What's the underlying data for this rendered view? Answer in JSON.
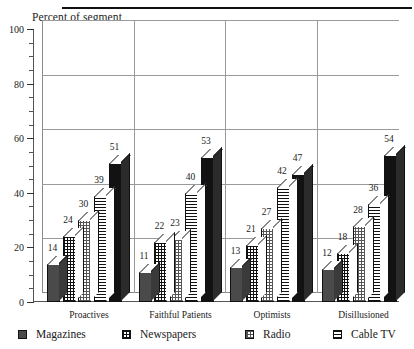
{
  "chart_data": {
    "type": "bar",
    "title": "Percent of segment",
    "xlabel": "",
    "ylabel": "Percent of segment",
    "ylim": [
      0,
      100
    ],
    "yticks": [
      0,
      20,
      40,
      60,
      80,
      100
    ],
    "ytick_labels": [
      "0",
      "20",
      "40",
      "60",
      "80",
      "100"
    ],
    "minor_tick_step": 5,
    "grid": true,
    "grid_orientation": "horizontal",
    "legend_position": "bottom",
    "style": "3d-grouped-columns",
    "categories": [
      "Proactives",
      "Faithful Patients",
      "Optimists",
      "Disillusioned"
    ],
    "series": [
      {
        "name": "Magazines",
        "pattern": "dots",
        "values": [
          14,
          11,
          13,
          12
        ]
      },
      {
        "name": "Newspapers",
        "pattern": "grid",
        "values": [
          24,
          22,
          21,
          18
        ]
      },
      {
        "name": "Radio",
        "pattern": "check",
        "values": [
          30,
          23,
          27,
          28
        ]
      },
      {
        "name": "Cable TV",
        "pattern": "hlines",
        "values": [
          39,
          40,
          42,
          36
        ]
      },
      {
        "name": "",
        "pattern": "solid",
        "values": [
          51,
          53,
          47,
          54
        ]
      }
    ],
    "data_labels": true
  },
  "legend": {
    "items": [
      {
        "label": "Magazines",
        "pattern": "dots"
      },
      {
        "label": "Newspapers",
        "pattern": "grid"
      },
      {
        "label": "Radio",
        "pattern": "check"
      },
      {
        "label": "Cable TV",
        "pattern": "hlines"
      }
    ]
  },
  "colors": {
    "axis": "#555555",
    "grid": "#9a9a9a",
    "bar_outline": "#111111",
    "solid_fill": "#121212",
    "background": "#ffffff"
  }
}
